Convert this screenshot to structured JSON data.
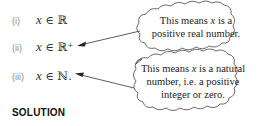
{
  "items": [
    {
      "label": "(i)",
      "var": "x",
      "relation": "∈",
      "set": "ℝ",
      "suffix": ""
    },
    {
      "label": "(ii)",
      "var": "x",
      "relation": "∈",
      "set": "ℝ⁺",
      "suffix": ""
    },
    {
      "label": "(iii)",
      "var": "x",
      "relation": "∈",
      "set": "ℕ",
      "suffix": "."
    }
  ],
  "callouts": [
    {
      "target": "(ii)",
      "lines": [
        "This means",
        "x",
        "is a",
        "positive real number."
      ]
    },
    {
      "target": "(iii)",
      "lines": [
        "This means",
        "x",
        "is a natural",
        "number, i.e. a positive",
        "integer or zero."
      ]
    }
  ],
  "heading": "SOLUTION"
}
